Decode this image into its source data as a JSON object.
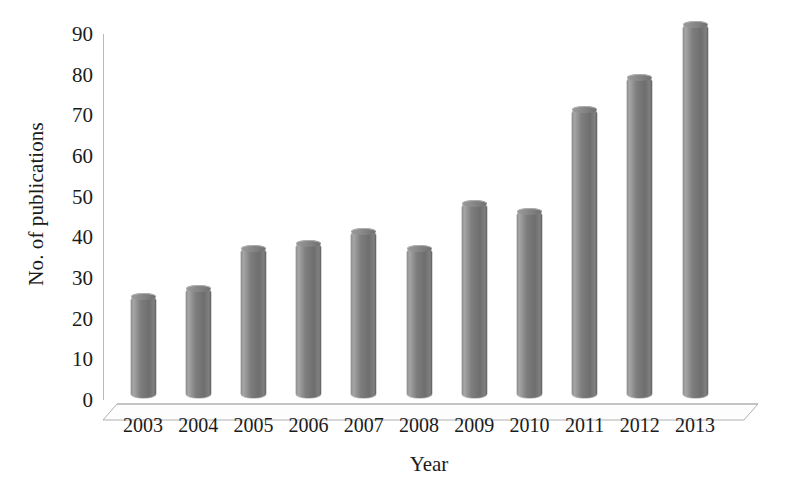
{
  "chart_data": {
    "type": "bar",
    "title": "",
    "xlabel": "Year",
    "ylabel": "No. of publications",
    "categories": [
      "2003",
      "2004",
      "2005",
      "2006",
      "2007",
      "2008",
      "2009",
      "2010",
      "2011",
      "2012",
      "2013"
    ],
    "values": [
      25,
      27,
      37,
      38,
      41,
      37,
      48,
      46,
      71,
      79,
      92
    ],
    "ylim": [
      0,
      90
    ],
    "yticks": [
      0,
      10,
      20,
      30,
      40,
      50,
      60,
      70,
      80,
      90
    ],
    "ytick_labels": [
      "0",
      "10",
      "20",
      "30",
      "40",
      "50",
      "60",
      "70",
      "80",
      "90"
    ],
    "grid": false,
    "legend": null,
    "style": {
      "bar_color": "#7e7e7e",
      "bar_edge_color": "#5e5e5e",
      "axis_color": "#b9b9b9",
      "text_color": "#1b1b1b",
      "background": "#ffffff",
      "three_d": true,
      "bar_shape": "cylinder"
    }
  }
}
